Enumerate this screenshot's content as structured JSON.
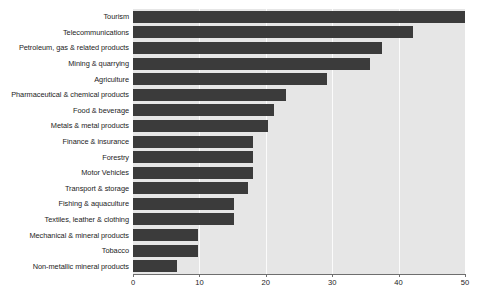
{
  "figure": {
    "clipped_top_text": "",
    "bar_color": "#3b3b3b",
    "plot_background": "#e6e6e6",
    "gridline_color": "#fbfbfb",
    "axis_color": "#6e6e6e",
    "text_color": "#1c1c1c"
  },
  "chart_data": {
    "type": "bar",
    "orientation": "horizontal",
    "title": "",
    "subtitle": "",
    "xlabel": "",
    "ylabel": "",
    "xlim": [
      0,
      50
    ],
    "ylim": null,
    "grid": true,
    "grid_axis": "x",
    "legend": false,
    "legend_position": "none",
    "xticks": [
      0,
      10,
      20,
      30,
      40,
      50
    ],
    "xtick_labels": [
      "0",
      "10",
      "20",
      "30",
      "40",
      "50"
    ],
    "categories": [
      "Tourism",
      "Telecommunications",
      "Petroleum, gas & related products",
      "Mining & quarrying",
      "Agriculture",
      "Pharmaceutical & chemical products",
      "Food & beverage",
      "Metals & metal products",
      "Finance & insurance",
      "Forestry",
      "Motor Vehicles",
      "Transport & storage",
      "Fishing & aquaculture",
      "Textiles, leather & clothing",
      "Mechanical & mineral products",
      "Tobacco",
      "Non-metallic mineral products"
    ],
    "values": [
      50.0,
      42.2,
      37.5,
      35.7,
      29.2,
      23.0,
      21.2,
      20.3,
      18.0,
      18.0,
      18.0,
      17.3,
      15.2,
      15.2,
      9.8,
      9.8,
      6.6
    ]
  }
}
